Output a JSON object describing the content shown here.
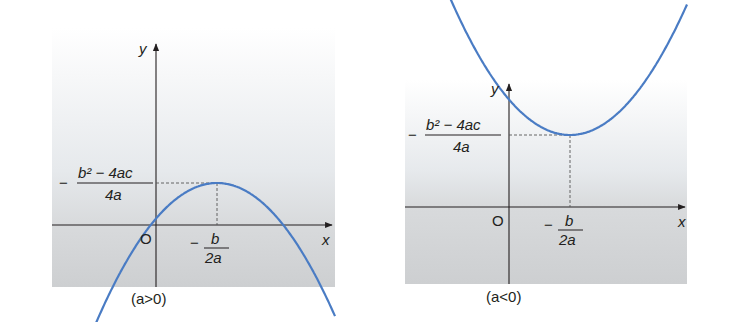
{
  "colors": {
    "curve": "#4a7cc4",
    "axis": "#231f20",
    "panel_top": "#ffffff",
    "panel_mid": "#e4e7ea",
    "panel_bottom": "#cfd1d3",
    "text": "#231f20"
  },
  "panels": [
    {
      "id": "a-positive",
      "caption": "(a>0)",
      "y_axis_label": "y",
      "x_axis_label": "x",
      "origin_label": "O",
      "vertex_x_label": {
        "sign": "−",
        "numerator": "b",
        "denominator": "2a"
      },
      "vertex_y_label": {
        "sign": "−",
        "numerator": "b² − 4ac",
        "denominator": "4a"
      },
      "opens": "up"
    },
    {
      "id": "a-negative",
      "caption": "(a<0)",
      "y_axis_label": "y",
      "x_axis_label": "x",
      "origin_label": "O",
      "vertex_x_label": {
        "sign": "−",
        "numerator": "b",
        "denominator": "2a"
      },
      "vertex_y_label": {
        "sign": "−",
        "numerator": "b² − 4ac",
        "denominator": "4a"
      },
      "opens": "down"
    }
  ]
}
